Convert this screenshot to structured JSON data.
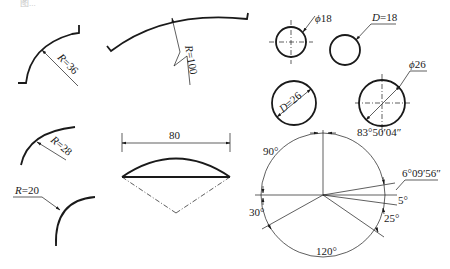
{
  "header": {
    "caption_fragment": "图..."
  },
  "colors": {
    "line": "#1a1a1a",
    "background": "#ffffff"
  },
  "arcs": {
    "r36": {
      "label_sym": "R",
      "label_val": "=36"
    },
    "r100": {
      "label_sym": "R",
      "label_val": "=100"
    },
    "r28": {
      "label_sym": "R",
      "label_val": "=28"
    },
    "r20": {
      "label_sym": "R",
      "label_val": "=20"
    }
  },
  "circles": {
    "phi18": {
      "label_sym": "ϕ",
      "label_val": "18"
    },
    "d18": {
      "label_sym": "D",
      "label_val": "=18"
    },
    "d26": {
      "label_sym": "D",
      "label_val": "=26"
    },
    "phi26": {
      "label_sym": "ϕ",
      "label_val": "26"
    }
  },
  "chord": {
    "dimension": "80"
  },
  "angles": {
    "a90": "90°",
    "a83": "83°50′04″",
    "a6": "6°09′56″",
    "a5": "5°",
    "a25": "25°",
    "a120": "120°",
    "a30": "30°"
  }
}
